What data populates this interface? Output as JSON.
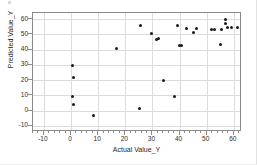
{
  "chart_data": {
    "type": "scatter",
    "title": "",
    "xlabel": "Actual Value_Y",
    "ylabel": "Predicted Value_Y",
    "xlim": [
      -14,
      63
    ],
    "ylim": [
      -14,
      64
    ],
    "xticks": [
      -10,
      0,
      10,
      20,
      30,
      40,
      50,
      60
    ],
    "yticks": [
      -10,
      0,
      10,
      20,
      30,
      40,
      50,
      60
    ],
    "xticklabels": [
      "-10",
      "0",
      "10",
      "20",
      "30",
      "40",
      "50",
      "60"
    ],
    "yticklabels": [
      "-10",
      "0",
      "10",
      "20",
      "30",
      "40",
      "50",
      "60"
    ],
    "grid": true,
    "legend": "none",
    "marker": "filled-circle",
    "marker_color": "#1a1a1a",
    "series": [
      {
        "name": "Predicted vs Actual",
        "points": [
          [
            0.6,
            29.6
          ],
          [
            0.8,
            21.8
          ],
          [
            0.5,
            9.0
          ],
          [
            0.8,
            4.2
          ],
          [
            8.4,
            -2.9
          ],
          [
            16.8,
            40.6
          ],
          [
            20.8,
            -13.6
          ],
          [
            25.4,
            1.2
          ],
          [
            25.6,
            55.9
          ],
          [
            29.6,
            50.6
          ],
          [
            31.6,
            46.4
          ],
          [
            32.4,
            47.2
          ],
          [
            34.2,
            19.7
          ],
          [
            38.2,
            9.0
          ],
          [
            39.4,
            55.9
          ],
          [
            39.8,
            42.7
          ],
          [
            40.6,
            42.8
          ],
          [
            42.6,
            53.6
          ],
          [
            45.2,
            51.2
          ],
          [
            46.2,
            53.8
          ],
          [
            51.8,
            52.9
          ],
          [
            53.0,
            52.9
          ],
          [
            55.0,
            43.4
          ],
          [
            55.4,
            53.4
          ],
          [
            56.8,
            57.2
          ],
          [
            57.0,
            59.6
          ],
          [
            57.8,
            54.3
          ],
          [
            59.2,
            54.2
          ],
          [
            61.2,
            54.4
          ],
          [
            62.8,
            31.6
          ]
        ]
      }
    ]
  }
}
